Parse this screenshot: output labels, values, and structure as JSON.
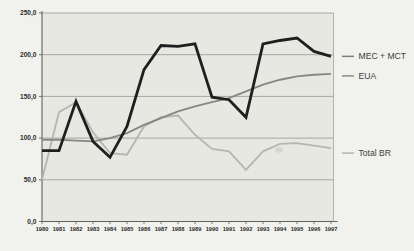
{
  "chart_data": {
    "type": "line",
    "title": "",
    "xlabel": "",
    "ylabel": "",
    "x": [
      "1980",
      "1981",
      "1982",
      "1983",
      "1984",
      "1985",
      "1986",
      "1987",
      "1988",
      "1989",
      "1990",
      "1991",
      "1992",
      "1993",
      "1994",
      "1995",
      "1996",
      "1997"
    ],
    "ylim": [
      0,
      250
    ],
    "yticks": [
      0,
      50,
      100,
      150,
      200,
      250
    ],
    "ytick_labels": [
      "0,0",
      "50,0",
      "100,0",
      "150,0",
      "200,0",
      "250,0"
    ],
    "grid": true,
    "legend_position": "right-outside",
    "series": [
      {
        "name": "MEC + MCT",
        "color": "#1f1f1f",
        "dash_color": "#7d7d79",
        "stroke_width": 2.8,
        "values": [
          85,
          85,
          144,
          96,
          77,
          114,
          182,
          211,
          210,
          213,
          149,
          146,
          125,
          213,
          217,
          220,
          204,
          198
        ]
      },
      {
        "name": "EUA",
        "color": "#878783",
        "dash_color": "#8a8a86",
        "stroke_width": 1.9,
        "values": [
          98,
          98,
          97,
          96,
          100,
          106,
          116,
          124,
          132,
          138,
          143,
          148,
          156,
          164,
          170,
          174,
          176,
          177
        ]
      },
      {
        "name": "Total BR",
        "color": "#b7b7b1",
        "dash_color": "#b5b5b0",
        "stroke_width": 1.9,
        "values": [
          50,
          131,
          143,
          107,
          82,
          80,
          114,
          125,
          127,
          104,
          87,
          84,
          62,
          84,
          93,
          94,
          91,
          88
        ]
      }
    ]
  },
  "colors": {
    "page_background": "#f1f1ed",
    "plot_background": "#e8e8e3",
    "gridline": "#90908c",
    "axis": "#62625e",
    "plot_border": "#a3a39e",
    "label_text": "#2b2b2b"
  }
}
